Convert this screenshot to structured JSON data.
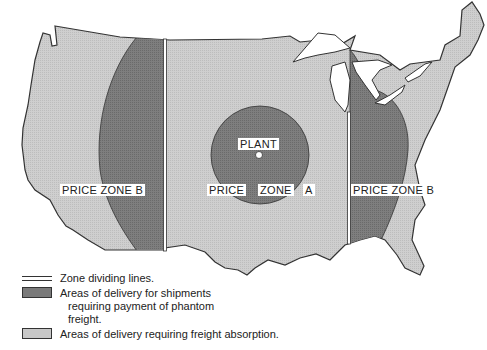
{
  "map": {
    "labels": {
      "plant": "PLANT",
      "zone_b_west": "PRICE ZONE B",
      "zone_a_price": "PRICE",
      "zone_a_zone": "ZONE",
      "zone_a_letter": "A",
      "zone_b_east": "PRICE ZONE B"
    },
    "colors": {
      "freight_absorption": "#c8c8c8",
      "phantom_freight": "#7a7a7a",
      "outline": "#333333",
      "water": "#ffffff"
    }
  },
  "legend": {
    "items": [
      {
        "symbol": "double-line",
        "text": "Zone dividing lines."
      },
      {
        "symbol": "dark-fill",
        "text_line1": "Areas of delivery for shipments",
        "text_line2": "requiring payment of phantom",
        "text_line3": "freight."
      },
      {
        "symbol": "light-fill",
        "text": "Areas of delivery requiring freight absorption."
      }
    ]
  }
}
